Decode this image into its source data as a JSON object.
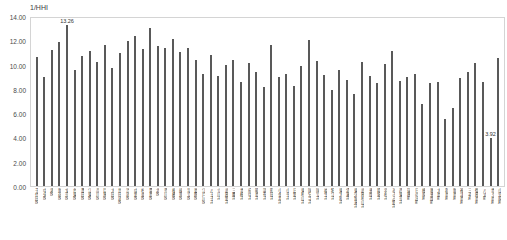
{
  "chart_data": {
    "type": "bar",
    "title": "",
    "subtitle": "",
    "ylabel": "1/HHI",
    "xlabel": "",
    "ylim": [
      0.0,
      14.0
    ],
    "ytick_labels": [
      "14.00",
      "12.00",
      "10.00",
      "8.00",
      "6.00",
      "4.00",
      "2.00",
      "0.00"
    ],
    "ytick_values": [
      14.0,
      12.0,
      10.0,
      8.0,
      6.0,
      4.0,
      2.0,
      0.0
    ],
    "grid": false,
    "legend": null,
    "bar_color": "#595959",
    "annotations": [
      {
        "category": "文京区",
        "value": 13.26,
        "label": "13.26"
      },
      {
        "category": "青ヶ島村",
        "value": 3.92,
        "label": "3.92"
      }
    ],
    "categories": [
      "千代田区",
      "中央区",
      "港区",
      "新宿区",
      "文京区",
      "台東区",
      "墨田区",
      "江東区",
      "品川区",
      "目黒区",
      "大田区",
      "世田谷区",
      "渋谷区",
      "中野区",
      "杉並区",
      "豊島区",
      "北区",
      "荒川区",
      "板橋区",
      "練馬区",
      "足立区",
      "葛飾区",
      "江戸川区",
      "八王子市",
      "立川市",
      "武蔵野市",
      "三鷹市",
      "青梅市",
      "府中市",
      "昭島市",
      "調布市",
      "町田市",
      "小金井市",
      "小平市",
      "日野市",
      "東村山市",
      "国分寺市",
      "国立市",
      "福生市",
      "狛江市",
      "東大和市",
      "清瀬市",
      "東久留米市",
      "武蔵村山市",
      "多摩市",
      "稲城市",
      "羽村市",
      "あきる野市",
      "西東京市",
      "瑞穂町",
      "日の出町",
      "檜原村",
      "奥多摩町",
      "大島町",
      "利島村",
      "新島村",
      "神津島村",
      "三宅村",
      "御蔵島村",
      "八丈町",
      "青ヶ島村",
      "小笠原村"
    ],
    "values": [
      10.62,
      8.95,
      11.22,
      11.9,
      13.26,
      9.58,
      10.72,
      11.15,
      10.22,
      11.65,
      9.7,
      10.95,
      11.95,
      12.35,
      11.28,
      13.05,
      11.55,
      11.4,
      12.1,
      11.05,
      11.35,
      10.4,
      9.25,
      10.8,
      9.05,
      9.95,
      10.35,
      8.58,
      10.1,
      9.42,
      8.18,
      11.62,
      8.95,
      9.2,
      8.25,
      9.88,
      12.05,
      10.3,
      9.15,
      7.88,
      9.52,
      8.72,
      7.55,
      10.18,
      9.05,
      8.45,
      10.05,
      11.1,
      8.68,
      8.95,
      9.25,
      6.75,
      8.52,
      8.58,
      5.55,
      6.4,
      8.9,
      9.35,
      10.15,
      8.55,
      3.92,
      10.55
    ]
  }
}
